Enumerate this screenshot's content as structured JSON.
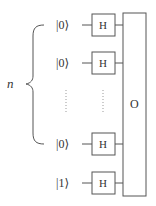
{
  "diagram": {
    "register_label": "n",
    "oracle_label": "O",
    "gate_label": "H",
    "qubits": [
      {
        "ket": "|0⟩",
        "gate": "H"
      },
      {
        "ket": "|0⟩",
        "gate": "H"
      },
      {
        "ket": "|0⟩",
        "gate": "H"
      },
      {
        "ket": "|1⟩",
        "gate": "H"
      }
    ],
    "colors": {
      "stroke": "#555555",
      "text": "#333333",
      "dots": "#999999"
    }
  }
}
